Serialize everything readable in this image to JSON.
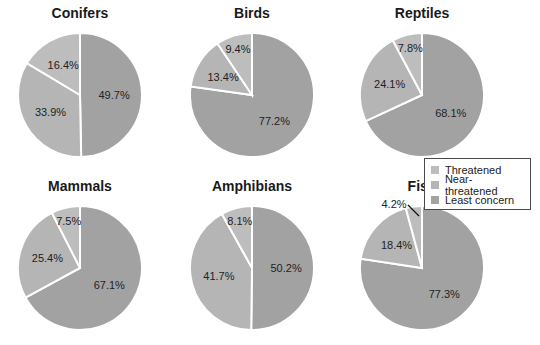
{
  "chart_data": [
    {
      "type": "pie",
      "title": "Conifers",
      "categories": [
        "Least concern",
        "Near-threatened",
        "Threatened"
      ],
      "values": [
        49.7,
        33.9,
        16.4
      ]
    },
    {
      "type": "pie",
      "title": "Birds",
      "categories": [
        "Least concern",
        "Near-threatened",
        "Threatened"
      ],
      "values": [
        77.2,
        13.4,
        9.4
      ]
    },
    {
      "type": "pie",
      "title": "Reptiles",
      "categories": [
        "Least concern",
        "Near-threatened",
        "Threatened"
      ],
      "values": [
        68.1,
        24.1,
        7.8
      ]
    },
    {
      "type": "pie",
      "title": "Mammals",
      "categories": [
        "Least concern",
        "Near-threatened",
        "Threatened"
      ],
      "values": [
        67.1,
        25.4,
        7.5
      ]
    },
    {
      "type": "pie",
      "title": "Amphibians",
      "categories": [
        "Least concern",
        "Near-threatened",
        "Threatened"
      ],
      "values": [
        50.2,
        41.7,
        8.1
      ]
    },
    {
      "type": "pie",
      "title": "Fish",
      "categories": [
        "Least concern",
        "Near-threatened",
        "Threatened"
      ],
      "values": [
        77.3,
        18.4,
        4.2
      ]
    }
  ],
  "legend": {
    "items": [
      {
        "label": "Threatened",
        "color": "#bdbdbd"
      },
      {
        "label": "Near-threatened",
        "color": "#b5b5b5"
      },
      {
        "label": "Least concern",
        "color": "#a2a2a2"
      }
    ]
  },
  "colors": {
    "least": "#a2a2a2",
    "near": "#b5b5b5",
    "threat": "#bdbdbd"
  }
}
